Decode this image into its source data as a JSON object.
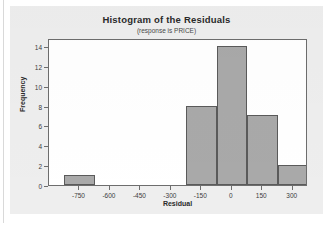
{
  "chart_data": {
    "type": "bar",
    "title": "Histogram of the Residuals",
    "subtitle": "(response is PRICE)",
    "xlabel": "Residual",
    "ylabel": "Frequency",
    "xlim": [
      -900,
      375
    ],
    "ylim": [
      0,
      14.8
    ],
    "grid": false,
    "legend": null,
    "bin_width": 150,
    "xticks": [
      -750,
      -600,
      -450,
      -300,
      -150,
      0,
      150,
      300
    ],
    "xtick_labels": [
      "-750",
      "-600",
      "-450",
      "-300",
      "-150",
      "0",
      "150",
      "300"
    ],
    "yticks": [
      0,
      2,
      4,
      6,
      8,
      10,
      12,
      14
    ],
    "ytick_labels": [
      "0",
      "2",
      "4",
      "6",
      "8",
      "10",
      "12",
      "14"
    ],
    "bars": [
      {
        "label": "-825 to -675",
        "bin_start": -825,
        "bin_end": -675,
        "value": 1
      },
      {
        "label": "-225 to -75",
        "bin_start": -225,
        "bin_end": -75,
        "value": 8
      },
      {
        "label": "-75 to 75",
        "bin_start": -75,
        "bin_end": 75,
        "value": 14
      },
      {
        "label": "75 to 225",
        "bin_start": 75,
        "bin_end": 225,
        "value": 7
      },
      {
        "label": "225 to 375",
        "bin_start": 225,
        "bin_end": 375,
        "value": 2
      }
    ],
    "categories": [
      "-825 to -675",
      "-225 to -75",
      "-75 to 75",
      "75 to 225",
      "225 to 375"
    ],
    "values": [
      1,
      8,
      14,
      7,
      2
    ],
    "colors": {
      "bar_fill": "#a9a9a9",
      "bar_stroke": "#5a5a5a",
      "plot_background": "#ffffff",
      "figure_background": "#eeeeee",
      "axis": "#6d6d6d",
      "text": "#2a2a2a"
    }
  }
}
